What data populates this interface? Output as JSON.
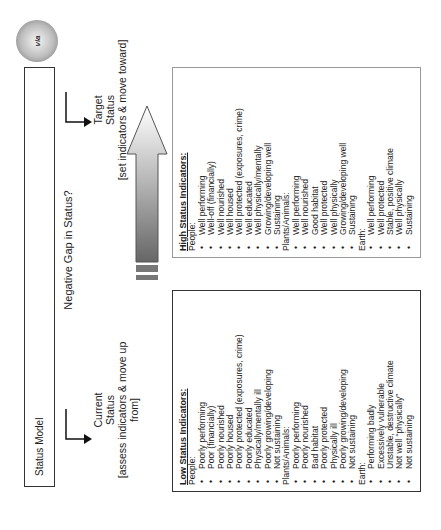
{
  "header": {
    "title": "Status Model",
    "logo_text": "via"
  },
  "flow": {
    "gap_label": "Negative Gap in Status?",
    "current": {
      "title_line1": "Current",
      "title_line2": "Status",
      "note": "[assess indicators & move up from]"
    },
    "target": {
      "title_line1": "Target",
      "title_line2": "Status",
      "note": "[set indicators & move toward]"
    }
  },
  "low_box": {
    "heading": "Low Status Indicators:",
    "groups": [
      {
        "label": "People:",
        "items": [
          "Poorly performing",
          "Poor (financially)",
          "Poorly nourished",
          "Poorly housed",
          "Poorly protected (exposures, crime)",
          "Poorly educated",
          "Physically/mentally ill",
          "Poorly growing/developing",
          "Not sustaining"
        ]
      },
      {
        "label": "Plants/Animals:",
        "items": [
          "Poorly performing",
          "Poorly nourished",
          "Bad habitat",
          "Poorly protected",
          "Physically ill",
          "Poorly growing/developing",
          "Not sustaining"
        ]
      },
      {
        "label": "Earth:",
        "items": [
          "Performing badly",
          "Excessively vulnerable",
          "Unstable, destructive climate",
          "Not well “physically”",
          "Not sustaining"
        ]
      }
    ]
  },
  "high_box": {
    "heading": "High Status Indicators:",
    "groups": [
      {
        "label": "People:",
        "items": [
          "Well performing",
          "Well-off (financially)",
          "Well nourished",
          "Well housed",
          "Well protected (exposures, crime)",
          "Well educated",
          "Well physically/mentally",
          "Growing/developing well",
          "Sustaining"
        ]
      },
      {
        "label": "Plants/Animals:",
        "items": [
          "Well performing",
          "Well nourished",
          "Good habitat",
          "Well protected",
          "Well physically",
          "Growing/developing well",
          "Sustaining"
        ]
      },
      {
        "label": "Earth:",
        "items": [
          "Well performing",
          "Well protected",
          "Stable, positive climate",
          "Well physically",
          "Sustaining"
        ]
      }
    ]
  }
}
